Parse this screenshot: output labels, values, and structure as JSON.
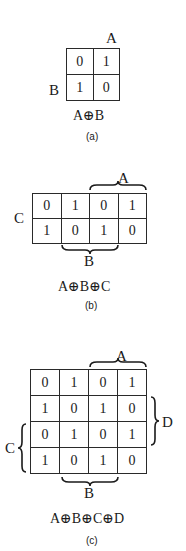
{
  "figures": [
    {
      "id": "a",
      "caption": "(a)",
      "expression": "A⊕B",
      "labels": {
        "top": "A",
        "left": "B"
      },
      "rows": [
        [
          "0",
          "1"
        ],
        [
          "1",
          "0"
        ]
      ]
    },
    {
      "id": "b",
      "caption": "(b)",
      "expression": "A⊕B⊕C",
      "labels": {
        "top_brace": "A",
        "left": "C",
        "bottom_brace": "B"
      },
      "rows": [
        [
          "0",
          "1",
          "0",
          "1"
        ],
        [
          "1",
          "0",
          "1",
          "0"
        ]
      ]
    },
    {
      "id": "c",
      "caption": "(c)",
      "expression": "A⊕B⊕C⊕D",
      "labels": {
        "top_brace": "A",
        "right_brace": "D",
        "left_brace": "C",
        "bottom_brace": "B"
      },
      "rows": [
        [
          "0",
          "1",
          "0",
          "1"
        ],
        [
          "1",
          "0",
          "1",
          "0"
        ],
        [
          "0",
          "1",
          "0",
          "1"
        ],
        [
          "1",
          "0",
          "1",
          "0"
        ]
      ]
    }
  ]
}
